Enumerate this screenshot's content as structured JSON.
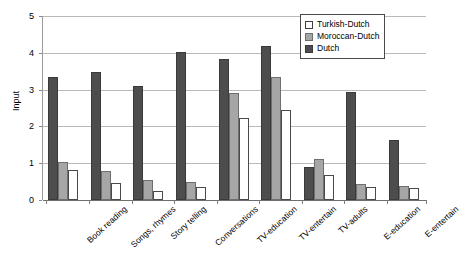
{
  "chart_data": {
    "type": "bar",
    "title": "",
    "xlabel": "",
    "ylabel": "Input",
    "ylim": [
      0,
      5
    ],
    "yticks": [
      0,
      1,
      2,
      3,
      4,
      5
    ],
    "grid": true,
    "legend_position": "top-right",
    "categories": [
      "Book reading",
      "Songs, rhymes",
      "Story telling",
      "Conversations",
      "TV-education",
      "TV-entertain",
      "TV-adults",
      "E-education",
      "E-entertain"
    ],
    "series": [
      {
        "name": "Turkish-Dutch",
        "color": "#ffffff",
        "values": [
          0.82,
          0.47,
          0.25,
          0.35,
          2.23,
          2.45,
          0.67,
          0.36,
          0.32
        ]
      },
      {
        "name": "Moroccan-Dutch",
        "color": "#a6a6a6",
        "values": [
          1.02,
          0.78,
          0.54,
          0.49,
          2.92,
          3.35,
          1.11,
          0.43,
          0.38
        ]
      },
      {
        "name": "Dutch",
        "color": "#4d4d4d",
        "values": [
          3.35,
          3.48,
          3.11,
          4.03,
          3.84,
          4.18,
          0.9,
          2.93,
          1.64
        ]
      }
    ]
  },
  "legend": {
    "items": [
      {
        "label": "Turkish-Dutch"
      },
      {
        "label": "Moroccan-Dutch"
      },
      {
        "label": "Dutch"
      }
    ]
  },
  "axes": {
    "y_label": "Input",
    "y_tick_labels": [
      "0",
      "1",
      "2",
      "3",
      "4",
      "5"
    ]
  }
}
